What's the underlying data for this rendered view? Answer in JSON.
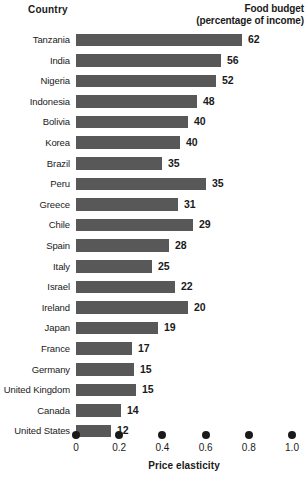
{
  "header": {
    "country_label": "Country",
    "budget_label_line1": "Food budget",
    "budget_label_line2": "(percentage of income)"
  },
  "axis": {
    "title": "Price elasticity",
    "ticks": [
      "0",
      "0.2",
      "0.4",
      "0.6",
      "0.8",
      "1.0"
    ],
    "tick_values": [
      0,
      0.2,
      0.4,
      0.6,
      0.8,
      1.0
    ]
  },
  "style": {
    "bar_color": "#585858",
    "text_color": "#1a1a1a",
    "background": "#ffffff"
  },
  "chart_data": {
    "type": "bar",
    "title": "",
    "orientation": "horizontal",
    "xlabel": "Price elasticity",
    "ylabel": "Country",
    "xlim": [
      0,
      1.0
    ],
    "grid": false,
    "legend": false,
    "note": "Bar length encodes price elasticity (bottom axis); the bold number at the end of each bar is the food budget as a percentage of income.",
    "categories": [
      "Tanzania",
      "India",
      "Nigeria",
      "Indonesia",
      "Bolivia",
      "Korea",
      "Brazil",
      "Peru",
      "Greece",
      "Chile",
      "Spain",
      "Italy",
      "Israel",
      "Ireland",
      "Japan",
      "France",
      "Germany",
      "United Kingdom",
      "Canada",
      "United States"
    ],
    "series": [
      {
        "name": "Price elasticity",
        "values": [
          0.77,
          0.67,
          0.65,
          0.56,
          0.52,
          0.48,
          0.4,
          0.6,
          0.47,
          0.54,
          0.43,
          0.35,
          0.46,
          0.52,
          0.38,
          0.26,
          0.27,
          0.28,
          0.21,
          0.16
        ]
      },
      {
        "name": "Food budget (percentage of income)",
        "values": [
          62,
          56,
          52,
          48,
          40,
          40,
          35,
          35,
          31,
          29,
          28,
          25,
          22,
          20,
          19,
          17,
          15,
          15,
          14,
          12
        ]
      }
    ],
    "value_labels": [
      "62",
      "56",
      "52",
      "48",
      "40",
      "40",
      "35",
      "35",
      "31",
      "29",
      "28",
      "25",
      "22",
      "20",
      "19",
      "17",
      "15",
      "15",
      "14",
      "12"
    ]
  }
}
